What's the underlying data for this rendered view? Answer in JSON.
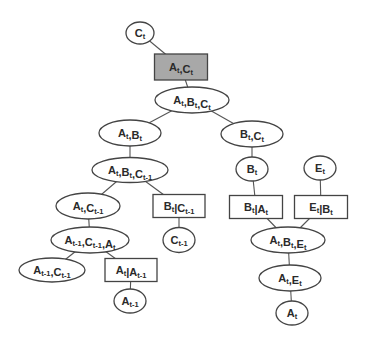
{
  "diagram": {
    "type": "junction-tree",
    "colors": {
      "stroke": "#444444",
      "edge": "#555555",
      "node_fill": "#ffffff",
      "highlight_fill": "#a8a8a8",
      "text": "#2a2a2a"
    },
    "nodes": [
      {
        "id": "n0",
        "shape": "ellipse",
        "label": "C",
        "sub": "t",
        "cx": 140,
        "cy": 33,
        "w": 28,
        "h": 22
      },
      {
        "id": "n1",
        "shape": "rect",
        "label": "A,C",
        "sub": "t,t",
        "cx": 181,
        "cy": 67,
        "w": 53,
        "h": 26,
        "shaded": true
      },
      {
        "id": "n2",
        "shape": "ellipse",
        "label": "A,B,C",
        "sub": "t,t,t",
        "cx": 192,
        "cy": 100,
        "w": 74,
        "h": 26
      },
      {
        "id": "n3",
        "shape": "ellipse",
        "label": "A,B",
        "sub": "t,t",
        "cx": 130,
        "cy": 133,
        "w": 62,
        "h": 26
      },
      {
        "id": "n4",
        "shape": "ellipse",
        "label": "B,C",
        "sub": "t,t",
        "cx": 252,
        "cy": 134,
        "w": 62,
        "h": 26
      },
      {
        "id": "n5",
        "shape": "ellipse",
        "label": "A,B,C",
        "sub": "t,t,t-1",
        "cx": 130,
        "cy": 170,
        "w": 76,
        "h": 25
      },
      {
        "id": "n6",
        "shape": "ellipse",
        "label": "B",
        "sub": "t",
        "cx": 252,
        "cy": 169,
        "w": 32,
        "h": 24
      },
      {
        "id": "n7",
        "shape": "ellipse",
        "label": "E",
        "sub": "t",
        "cx": 320,
        "cy": 168,
        "w": 32,
        "h": 24
      },
      {
        "id": "n8",
        "shape": "ellipse",
        "label": "A,C",
        "sub": "t,t-1",
        "cx": 88,
        "cy": 206,
        "w": 64,
        "h": 26
      },
      {
        "id": "n9",
        "shape": "rect",
        "label": "B|C",
        "sub": "t,t-1",
        "cx": 179,
        "cy": 206,
        "w": 52,
        "h": 23
      },
      {
        "id": "n10",
        "shape": "rect",
        "label": "B|A",
        "sub": "t,t",
        "cx": 256,
        "cy": 207,
        "w": 53,
        "h": 23
      },
      {
        "id": "n11",
        "shape": "rect",
        "label": "E|B",
        "sub": "t,t",
        "cx": 321,
        "cy": 207,
        "w": 53,
        "h": 23
      },
      {
        "id": "n12",
        "shape": "ellipse",
        "label": "A,C,A",
        "sub": "t-1,t-1,t",
        "cx": 90,
        "cy": 240,
        "w": 78,
        "h": 26
      },
      {
        "id": "n13",
        "shape": "ellipse",
        "label": "C",
        "sub": "t-1",
        "cx": 179,
        "cy": 240,
        "w": 32,
        "h": 25
      },
      {
        "id": "n14",
        "shape": "ellipse",
        "label": "A,B,E",
        "sub": "t,t,t",
        "cx": 288,
        "cy": 240,
        "w": 74,
        "h": 26
      },
      {
        "id": "n15",
        "shape": "ellipse",
        "label": "A,C",
        "sub": "t-1,t-1",
        "cx": 52,
        "cy": 270,
        "w": 66,
        "h": 24
      },
      {
        "id": "n16",
        "shape": "rect",
        "label": "A|A",
        "sub": "t,t-1",
        "cx": 131,
        "cy": 270,
        "w": 52,
        "h": 23
      },
      {
        "id": "n17",
        "shape": "ellipse",
        "label": "A,E",
        "sub": "t,t",
        "cx": 290,
        "cy": 278,
        "w": 62,
        "h": 26
      },
      {
        "id": "n18",
        "shape": "ellipse",
        "label": "A",
        "sub": "t-1",
        "cx": 130,
        "cy": 301,
        "w": 32,
        "h": 24
      },
      {
        "id": "n19",
        "shape": "ellipse",
        "label": "A",
        "sub": "t",
        "cx": 292,
        "cy": 313,
        "w": 32,
        "h": 24
      }
    ],
    "node_labels": {
      "n0": "Ct",
      "n1": "At,Ct",
      "n2": "At,Bt,Ct",
      "n3": "At,Bt",
      "n4": "Bt,Ct",
      "n5": "At,Bt,Ct-1",
      "n6": "Bt",
      "n7": "Et",
      "n8": "At,Ct-1",
      "n9": "Bt|Ct-1",
      "n10": "Bt|At",
      "n11": "Et|Bt",
      "n12": "At-1,Ct-1,At",
      "n13": "Ct-1",
      "n14": "At,Bt,Et",
      "n15": "At-1,Ct-1",
      "n16": "At|At-1",
      "n17": "At,Et",
      "n18": "At-1",
      "n19": "At"
    },
    "edges": [
      [
        "n0",
        "n1"
      ],
      [
        "n1",
        "n2"
      ],
      [
        "n2",
        "n3"
      ],
      [
        "n2",
        "n4"
      ],
      [
        "n3",
        "n5"
      ],
      [
        "n4",
        "n6"
      ],
      [
        "n5",
        "n8"
      ],
      [
        "n5",
        "n9"
      ],
      [
        "n6",
        "n10"
      ],
      [
        "n7",
        "n11"
      ],
      [
        "n8",
        "n12"
      ],
      [
        "n9",
        "n13"
      ],
      [
        "n10",
        "n14"
      ],
      [
        "n11",
        "n14"
      ],
      [
        "n12",
        "n15"
      ],
      [
        "n12",
        "n16"
      ],
      [
        "n14",
        "n17"
      ],
      [
        "n16",
        "n18"
      ],
      [
        "n17",
        "n19"
      ]
    ]
  }
}
